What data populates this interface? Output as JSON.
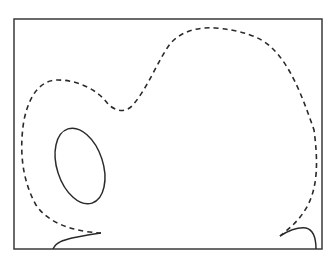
{
  "diagram": {
    "type": "contour-sketch",
    "background": "#ffffff",
    "stroke_color": "#2a2a2a",
    "frame": {
      "x": 14,
      "y": 19,
      "width": 308,
      "height": 230
    },
    "elements": [
      {
        "name": "dashed-boundary-curve",
        "style": "dashed"
      },
      {
        "name": "solid-ellipse",
        "style": "solid",
        "cx": 80,
        "cy": 166,
        "rx": 23,
        "ry": 39
      },
      {
        "name": "solid-curve-bottom-left",
        "style": "solid"
      },
      {
        "name": "solid-curve-bottom-right",
        "style": "solid"
      }
    ]
  }
}
